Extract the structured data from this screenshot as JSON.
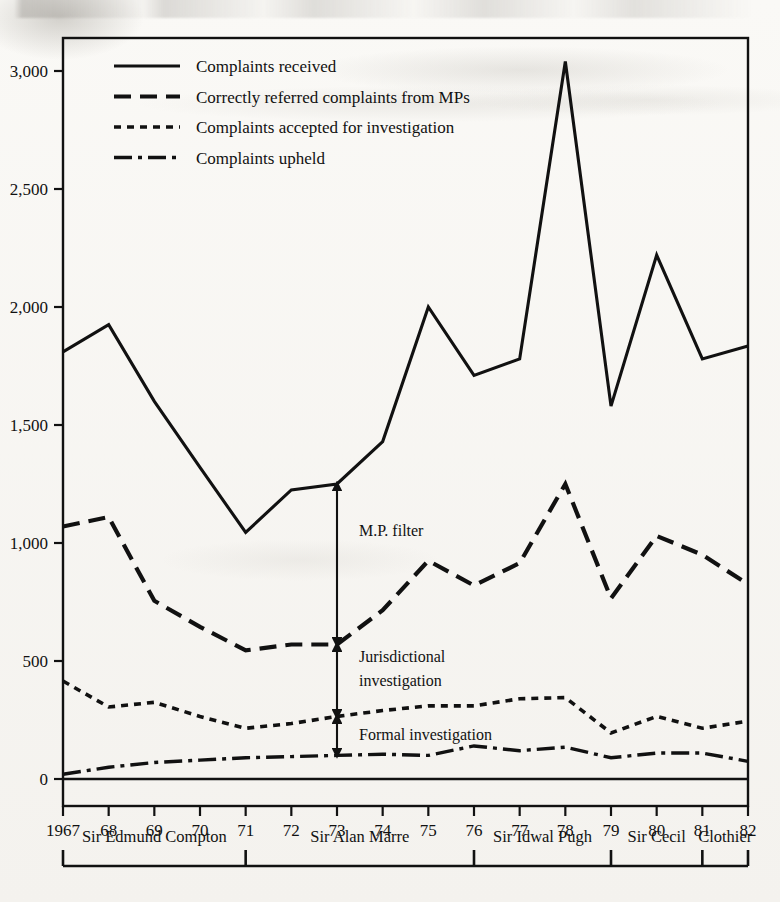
{
  "chart_data": {
    "type": "line",
    "title": "",
    "xlabel": "",
    "ylabel": "",
    "x": [
      1967,
      1968,
      1969,
      1970,
      1971,
      1972,
      1973,
      1974,
      1975,
      1976,
      1977,
      1978,
      1979,
      1980,
      1981,
      1982
    ],
    "xticklabels": [
      "1967",
      "68",
      "69",
      "70",
      "71",
      "72",
      "73",
      "74",
      "75",
      "76",
      "77",
      "78",
      "79",
      "80",
      "81",
      "82"
    ],
    "yticklabels": [
      "0",
      "500",
      "1,000",
      "1,500",
      "2,000",
      "2,500",
      "3,000"
    ],
    "ytickvalues": [
      0,
      500,
      1000,
      1500,
      2000,
      2500,
      3000
    ],
    "ylim": [
      0,
      3150
    ],
    "grid": false,
    "legend_position": "top-left",
    "series": [
      {
        "name": "Complaints received",
        "style": "solid",
        "values": [
          1810,
          1925,
          1600,
          1320,
          1045,
          1225,
          1250,
          1430,
          2000,
          1710,
          1780,
          3040,
          1580,
          2220,
          1780,
          1835
        ]
      },
      {
        "name": "Correctly referred complaints from MPs",
        "style": "dashed",
        "values": [
          1070,
          1110,
          755,
          645,
          545,
          570,
          570,
          715,
          925,
          820,
          915,
          1250,
          765,
          1030,
          950,
          825
        ]
      },
      {
        "name": "Complaints accepted for investigation",
        "style": "dotted",
        "values": [
          415,
          305,
          325,
          265,
          215,
          235,
          265,
          290,
          310,
          310,
          340,
          345,
          195,
          265,
          215,
          245
        ]
      },
      {
        "name": "Complaints upheld",
        "style": "dashdot",
        "values": [
          20,
          50,
          70,
          80,
          90,
          95,
          100,
          105,
          100,
          140,
          120,
          135,
          90,
          110,
          110,
          75
        ]
      }
    ],
    "annotations": [
      {
        "label": "M.P. filter",
        "from_series": "Correctly referred complaints from MPs",
        "to_series": "Complaints received",
        "at_x": 1973
      },
      {
        "label": "Jurisdictional investigation",
        "from_series": "Complaints accepted for investigation",
        "to_series": "Correctly referred complaints from MPs",
        "at_x": 1973
      },
      {
        "label": "Formal investigation",
        "from_series": "Complaints upheld",
        "to_series": "Complaints accepted for investigation",
        "at_x": 1973
      }
    ],
    "tenure_bands": [
      {
        "label": "Sir Edmund Compton",
        "start": 1967,
        "end": 1971
      },
      {
        "label": "Sir Alan Marre",
        "start": 1971,
        "end": 1976
      },
      {
        "label": "Sir Idwal Pugh",
        "start": 1976,
        "end": 1979
      },
      {
        "label": "Sir Cecil",
        "start": 1979,
        "end": 1981
      },
      {
        "label": "Clothier",
        "start": 1981,
        "end": 1982
      }
    ]
  },
  "legend": {
    "items": [
      {
        "label": "Complaints received"
      },
      {
        "label": "Correctly referred complaints from MPs"
      },
      {
        "label": "Complaints accepted for investigation"
      },
      {
        "label": "Complaints upheld"
      }
    ]
  },
  "annotation_text": {
    "mp_filter": "M.P. filter",
    "jurisdictional_line1": "Jurisdictional",
    "jurisdictional_line2": "investigation",
    "formal": "Formal investigation"
  },
  "axis": {
    "y_labels": [
      "3,000",
      "2,500",
      "2,000",
      "1,500",
      "1,000",
      "500",
      "0"
    ],
    "x_labels": [
      "1967",
      "68",
      "69",
      "70",
      "71",
      "72",
      "73",
      "74",
      "75",
      "76",
      "77",
      "78",
      "79",
      "80",
      "81",
      "82"
    ]
  },
  "tenures": {
    "items": [
      "Sir Edmund Compton",
      "Sir Alan Marre",
      "Sir Idwal Pugh",
      "Sir Cecil",
      "Clothier"
    ]
  },
  "colors": {
    "ink": "#111111",
    "paper": "#f7f6f3"
  }
}
